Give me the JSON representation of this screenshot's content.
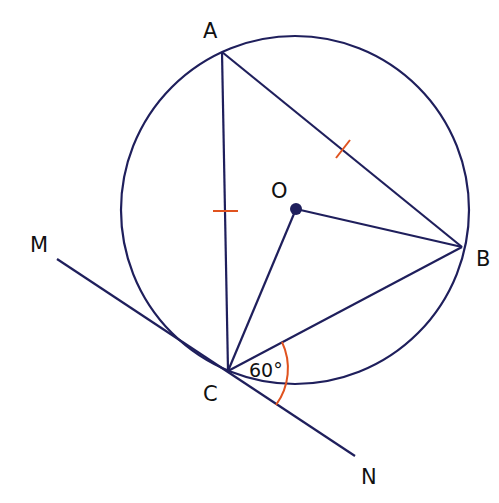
{
  "figure": {
    "colors": {
      "line": "#1f1f5c",
      "mark": "#e0531f",
      "label": "#111111",
      "background": "#ffffff"
    },
    "labels": {
      "A": "A",
      "B": "B",
      "C": "C",
      "O": "O",
      "M": "M",
      "N": "N",
      "angle": "60°"
    },
    "points": {
      "A": [
        222,
        52
      ],
      "B": [
        462,
        247
      ],
      "C": [
        228,
        371
      ],
      "O": [
        296,
        209
      ],
      "M_end": [
        57,
        259
      ],
      "N_end": [
        355,
        456
      ]
    },
    "circle": {
      "cx": 295,
      "cy": 210,
      "r": 174
    },
    "annotations": {
      "equal_sides": [
        "AC",
        "AB"
      ],
      "angle_BCN": "60°"
    }
  }
}
